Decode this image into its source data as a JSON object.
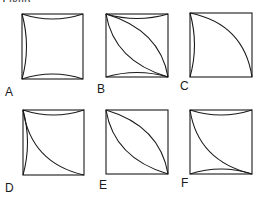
{
  "header": {
    "cropped_text_left": "Figure",
    "cropped_text_mid": "p",
    "cropped_text_right": "g"
  },
  "stroke_color": "#1a1a1a",
  "panels": [
    {
      "label": "A",
      "description": "Square with inward-bowing curves on top, bottom and left edges"
    },
    {
      "label": "B",
      "description": "Square with inward-bowing top and bottom curves plus lens from top-left to bottom-right"
    },
    {
      "label": "C",
      "description": "Square with inward-bowing left curve plus arc from top-left to bottom-right bulging up-right"
    },
    {
      "label": "D",
      "description": "Square with inward-bowing top and left curves plus arc from top-left to bottom-right bulging down-left"
    },
    {
      "label": "E",
      "description": "Square with lens from top-left to bottom-right"
    },
    {
      "label": "F",
      "description": "Square with inward-bowing top and bottom curves plus arc from top-left to bottom-right bulging down-left"
    }
  ]
}
